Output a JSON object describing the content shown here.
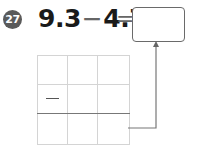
{
  "problem": {
    "number": "27",
    "operand1": "9.3",
    "operator": "−",
    "operand2": "4.7",
    "equals": "=",
    "answer": ""
  },
  "work_grid": {
    "rows": 3,
    "columns": 3,
    "cells": [
      [
        "",
        "",
        ""
      ],
      [
        "—",
        "",
        ""
      ],
      [
        "",
        "",
        ""
      ]
    ],
    "result_row_separator": "thick line above row 3"
  },
  "colors": {
    "badge": "#5a5a5a",
    "text": "#1a1a1a",
    "grid_line": "#d4d4d4",
    "box_border": "#6a6a6a"
  }
}
